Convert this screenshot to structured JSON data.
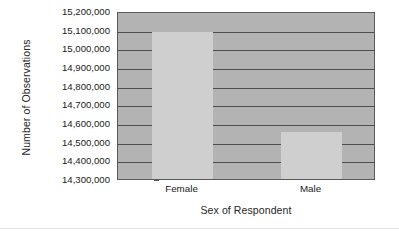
{
  "chart_data": {
    "type": "bar",
    "title": "",
    "subtitle": "",
    "xlabel": "Sex of Respondent",
    "ylabel": "Number of Observations",
    "categories": [
      "Female",
      "Male"
    ],
    "values": [
      15090000,
      14550000
    ],
    "series": [
      {
        "name": "Number of Observations",
        "values": [
          15090000,
          14550000
        ]
      }
    ],
    "ylim": [
      14300000,
      15200000
    ],
    "yticks": [
      14300000,
      14400000,
      14500000,
      14600000,
      14700000,
      14800000,
      14900000,
      15000000,
      15100000,
      15200000
    ],
    "ytick_labels": [
      "14,300,000",
      "14,400,000",
      "14,500,000",
      "14,600,000",
      "14,700,000",
      "14,800,000",
      "14,900,000",
      "15,000,000",
      "15,100,000",
      "15,200,000"
    ],
    "grid": true,
    "grid_axis": "y",
    "legend": false,
    "legend_position": "none",
    "annotations": [],
    "colors": {
      "plot_background": "#b3b3b3",
      "bar_fill": "#cfcfcf",
      "gridline": "#4d4d4d",
      "axis_border": "#5a5a5a",
      "text": "#1a1a1a",
      "page_background": "#ffffff",
      "divider": "#e3e3e3"
    }
  }
}
